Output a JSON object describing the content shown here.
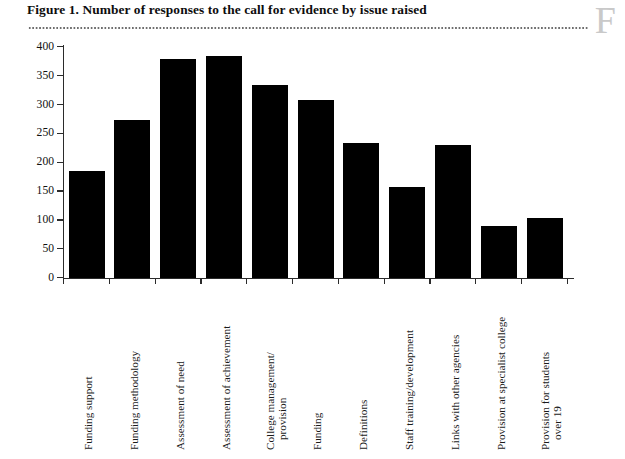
{
  "figure": {
    "title": "Figure 1.  Number of responses to the call for evidence by issue raised",
    "corner_mark": "F"
  },
  "chart_data": {
    "type": "bar",
    "title": "Figure 1.  Number of responses to the call for evidence by issue raised",
    "xlabel": "",
    "ylabel": "",
    "ylim": [
      0,
      400
    ],
    "ytick_step": 50,
    "grid": false,
    "legend": null,
    "bar_color": "#000000",
    "categories": [
      "Funding support",
      "Funding methodology",
      "Assessment of need",
      "Assessment of achievement",
      "College management/\nprovision",
      "Funding",
      "Definitions",
      "Staff training/development",
      "Links with other agencies",
      "Provision at specialist college",
      "Provision for students\nover 19"
    ],
    "values": [
      185,
      273,
      378,
      384,
      333,
      308,
      234,
      157,
      229,
      89,
      104
    ],
    "ytick_labels": [
      "0",
      "50",
      "100",
      "150",
      "200",
      "250",
      "300",
      "350",
      "400"
    ],
    "ytick_values": [
      0,
      50,
      100,
      150,
      200,
      250,
      300,
      350,
      400
    ]
  }
}
